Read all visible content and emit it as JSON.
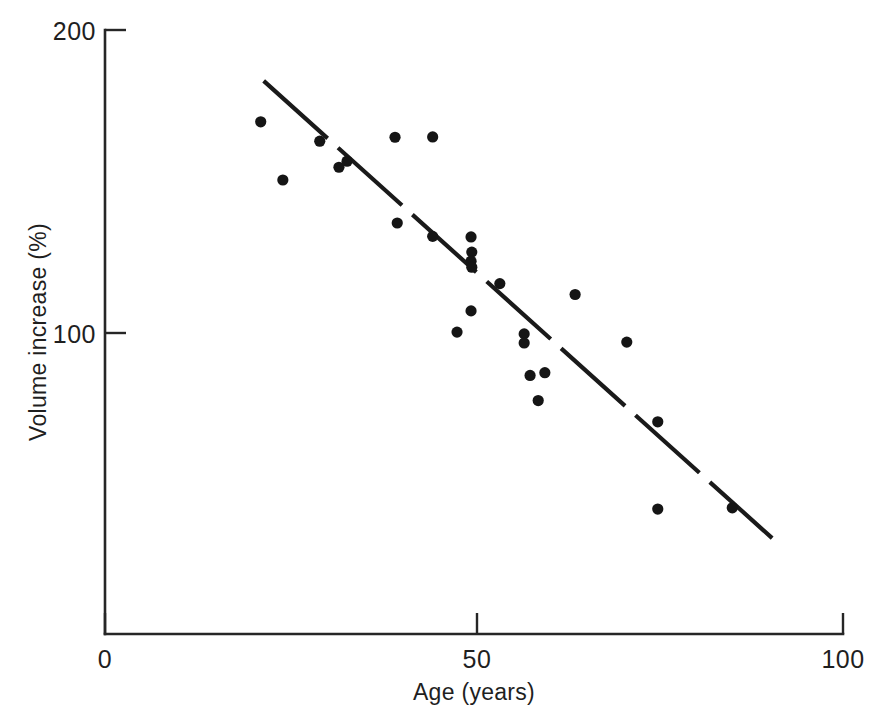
{
  "chart_data": {
    "type": "scatter",
    "title": "",
    "xlabel": "Age (years)",
    "ylabel": "Volume increase (%)",
    "xlim": [
      0,
      100
    ],
    "ylim": [
      0,
      200
    ],
    "xticks": [
      0,
      50,
      100
    ],
    "xtick_labels": [
      "0",
      "50",
      "100"
    ],
    "yticks": [
      100,
      200
    ],
    "ytick_labels": [
      "100",
      "200"
    ],
    "grid": false,
    "legend": null,
    "marker": "filled-circle",
    "marker_color": "#151515",
    "points": [
      {
        "x": 21.1,
        "y": 169.7
      },
      {
        "x": 24.1,
        "y": 150.5
      },
      {
        "x": 29.1,
        "y": 163.3
      },
      {
        "x": 31.7,
        "y": 154.7
      },
      {
        "x": 32.8,
        "y": 156.7
      },
      {
        "x": 39.3,
        "y": 164.6
      },
      {
        "x": 39.6,
        "y": 136.3
      },
      {
        "x": 44.4,
        "y": 164.7
      },
      {
        "x": 44.4,
        "y": 131.9
      },
      {
        "x": 49.6,
        "y": 131.7
      },
      {
        "x": 49.7,
        "y": 126.7
      },
      {
        "x": 47.7,
        "y": 100.3
      },
      {
        "x": 49.6,
        "y": 123.7
      },
      {
        "x": 49.7,
        "y": 121.7
      },
      {
        "x": 49.6,
        "y": 107.3
      },
      {
        "x": 53.5,
        "y": 116.3
      },
      {
        "x": 56.8,
        "y": 99.7
      },
      {
        "x": 56.8,
        "y": 96.7
      },
      {
        "x": 57.6,
        "y": 86.0
      },
      {
        "x": 59.6,
        "y": 86.9
      },
      {
        "x": 58.7,
        "y": 77.7
      },
      {
        "x": 63.7,
        "y": 112.7
      },
      {
        "x": 70.7,
        "y": 97.0
      },
      {
        "x": 74.9,
        "y": 70.7
      },
      {
        "x": 74.9,
        "y": 41.9
      },
      {
        "x": 85.0,
        "y": 42.3
      }
    ],
    "trend_line": {
      "style": "dashed",
      "x_start": 21.5,
      "y_start": 183.2,
      "x_end": 90.4,
      "y_end": 32.3
    }
  },
  "axis": {
    "y_label": "Volume increase (%)",
    "x_label": "Age (years)",
    "y_top_label": "200",
    "y_mid_label": "100",
    "x_left_label": "0",
    "x_mid_label": "50",
    "x_right_label": "100"
  },
  "colors": {
    "ink": "#1a1a1a",
    "marker": "#151515",
    "background": "#ffffff"
  }
}
